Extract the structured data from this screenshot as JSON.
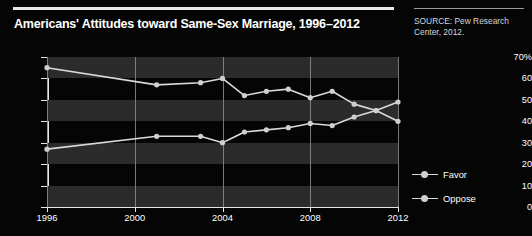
{
  "title": "Americans' Attitudes toward Same-Sex Marriage, 1996–2012",
  "source": "SOURCE: Pew Research Center, 2012.",
  "legend": {
    "favor_label": "Favor",
    "oppose_label": "Oppose"
  },
  "colors": {
    "background": "#050505",
    "band": "#2b2b2b",
    "axis": "#e6e6e6",
    "gridline": "#8d8d8d",
    "line": "#d9d9d9",
    "marker": "#cfcfcf",
    "text": "#ffffff",
    "source_text": "#d6d6d6"
  },
  "chart_data": {
    "type": "line",
    "title": "Americans' Attitudes toward Same-Sex Marriage, 1996–2012",
    "xlabel": "",
    "ylabel": "",
    "xlim": [
      1996,
      2012
    ],
    "ylim": [
      0,
      70
    ],
    "grid": true,
    "legend_position": "right",
    "xticks": [
      1996,
      2000,
      2004,
      2008,
      2012
    ],
    "xtick_labels": [
      "1996",
      "2000",
      "2004",
      "2008",
      "2012"
    ],
    "yticks": [
      0,
      10,
      20,
      30,
      40,
      50,
      60,
      70
    ],
    "ytick_labels": [
      "0",
      "10",
      "20",
      "30",
      "40",
      "50",
      "60",
      "70%"
    ],
    "series": [
      {
        "name": "Oppose",
        "x": [
          1996,
          2001,
          2003,
          2004,
          2005,
          2006,
          2007,
          2008,
          2009,
          2010,
          2011,
          2012
        ],
        "values": [
          65,
          57,
          58,
          60,
          52,
          54,
          55,
          51,
          54,
          48,
          45,
          40
        ]
      },
      {
        "name": "Favor",
        "x": [
          1996,
          2001,
          2003,
          2004,
          2005,
          2006,
          2007,
          2008,
          2009,
          2010,
          2011,
          2012
        ],
        "values": [
          27,
          33,
          33,
          30,
          35,
          36,
          37,
          39,
          38,
          42,
          45,
          49
        ]
      }
    ]
  }
}
